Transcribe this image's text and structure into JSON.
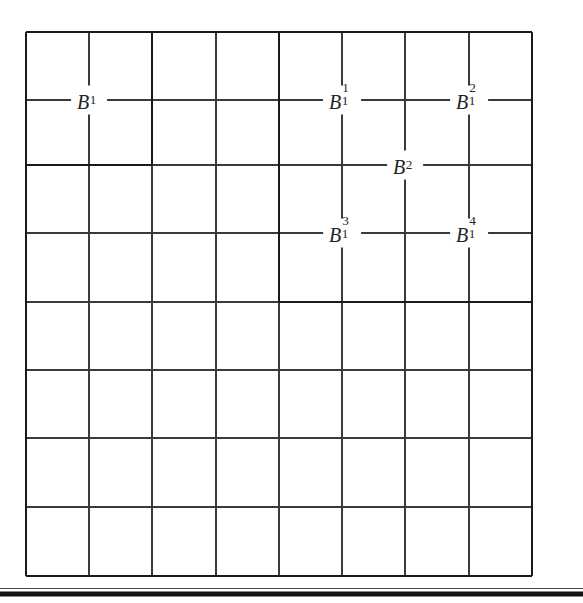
{
  "figure": {
    "kind": "dyadic-grid-diagram",
    "background_color": "#ffffff",
    "line_color": "#3a3a3a",
    "thick_line_color": "#1a1a1a",
    "text_color": "#242424",
    "grid": {
      "columns": 8,
      "rows": 8,
      "left": 26,
      "top": 32,
      "right": 532,
      "bottom": 576,
      "x_lines": [
        26,
        89,
        152,
        216,
        279,
        342,
        405,
        469,
        532
      ],
      "y_lines": [
        32,
        100,
        165,
        233,
        302,
        370,
        438,
        507,
        576
      ]
    },
    "thick_blocks": [
      {
        "name": "B1-block",
        "col_start": 0,
        "col_end": 2,
        "row_start": 0,
        "row_end": 2,
        "x": 26,
        "y": 32,
        "width": 126,
        "height": 133
      },
      {
        "name": "B2-block",
        "col_start": 4,
        "col_end": 8,
        "row_start": 0,
        "row_end": 4,
        "x": 279,
        "y": 32,
        "width": 253,
        "height": 270
      }
    ],
    "bottom_rule": {
      "name": "horizontal-rule",
      "x1": 0,
      "x2": 583,
      "y": 593,
      "thickness": 5
    },
    "labels": [
      {
        "id": "B1",
        "base": "B",
        "sup": "",
        "sub": "1",
        "text": "B1",
        "x": 89,
        "y": 100
      },
      {
        "id": "B1-1",
        "base": "B",
        "sup": "1",
        "sub": "1",
        "text": "B11",
        "x": 342,
        "y": 100
      },
      {
        "id": "B1-2",
        "base": "B",
        "sup": "2",
        "sub": "1",
        "text": "B12",
        "x": 469,
        "y": 100
      },
      {
        "id": "B2",
        "base": "B",
        "sup": "",
        "sub": "2",
        "text": "B2",
        "x": 405,
        "y": 165
      },
      {
        "id": "B1-3",
        "base": "B",
        "sup": "3",
        "sub": "1",
        "text": "B13",
        "x": 342,
        "y": 233
      },
      {
        "id": "B1-4",
        "base": "B",
        "sup": "4",
        "sub": "1",
        "text": "B14",
        "x": 469,
        "y": 233
      }
    ]
  }
}
